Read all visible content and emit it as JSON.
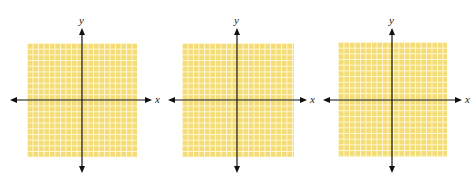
{
  "figure": {
    "grid_color": "#f4dd78",
    "grid_line_color": "#fffadc",
    "axis_color": "#111111",
    "grid_cells": 20,
    "panels": [
      {
        "id": 1,
        "x_label": "x",
        "y_label": "y"
      },
      {
        "id": 2,
        "x_label": "x",
        "y_label": "y"
      },
      {
        "id": 3,
        "x_label": "x",
        "y_label": "y"
      }
    ]
  }
}
